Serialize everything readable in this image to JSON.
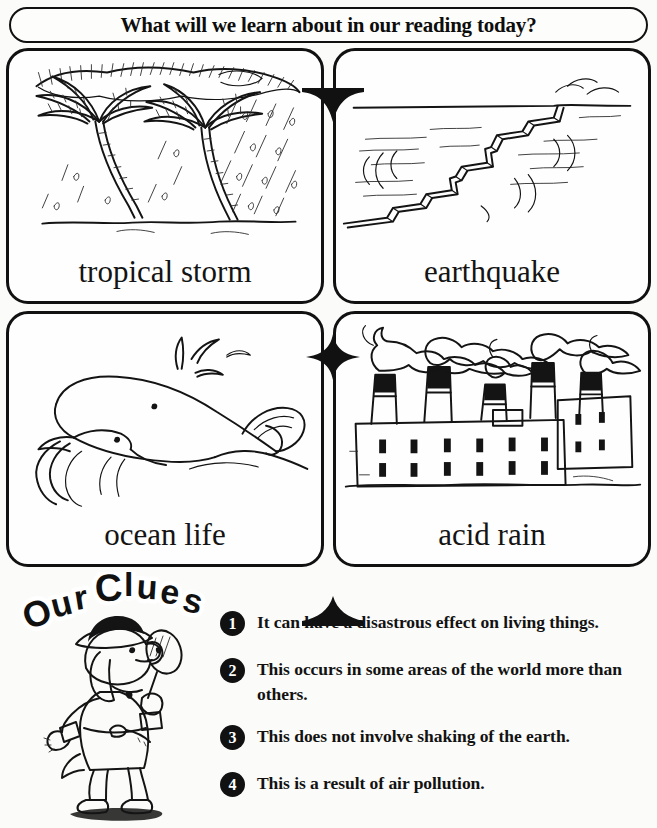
{
  "worksheet": {
    "title": "What will we learn about in our reading today?"
  },
  "choices": [
    {
      "label": "tropical storm",
      "icon": "palm-trees-storm-icon"
    },
    {
      "label": "earthquake",
      "icon": "ground-fissure-icon"
    },
    {
      "label": "ocean life",
      "icon": "whale-icon"
    },
    {
      "label": "acid rain",
      "icon": "factory-smokestacks-icon"
    }
  ],
  "clues_section": {
    "heading": "Our Clues",
    "mascot": "detective-dog-icon",
    "items": [
      {
        "number": "1",
        "text": "It can have a disastrous effect on living things."
      },
      {
        "number": "2",
        "text": "This occurs in some areas of the world more than others."
      },
      {
        "number": "3",
        "text": "This does not involve shaking of the earth."
      },
      {
        "number": "4",
        "text": "This is a result of air pollution."
      }
    ]
  },
  "colors": {
    "ink": "#141414",
    "paper": "#fbfbf9"
  }
}
